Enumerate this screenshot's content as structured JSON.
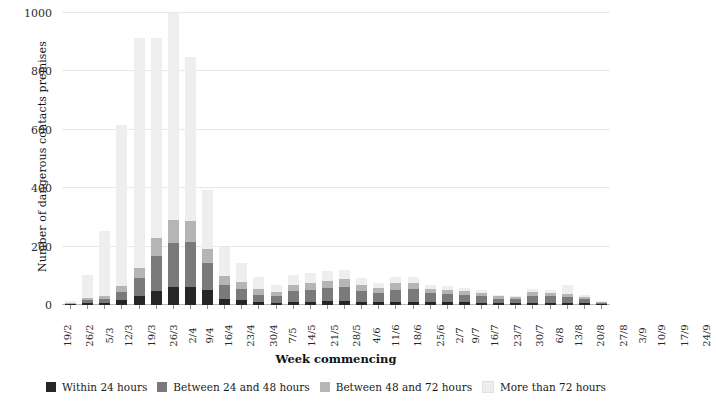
{
  "chart_data": {
    "type": "bar",
    "stacked": true,
    "title": "",
    "xlabel": "Week commencing",
    "ylabel": "Number of dangerous contacts premises",
    "ylim": [
      0,
      1000
    ],
    "yticks": [
      0,
      200,
      400,
      600,
      800,
      1000
    ],
    "ytick_labels": [
      "0",
      "200",
      "400",
      "600",
      "800",
      "1000"
    ],
    "grid": "horizontal",
    "legend_position": "bottom",
    "categories": [
      "19/2",
      "26/2",
      "5/3",
      "12/3",
      "19/3",
      "26/3",
      "2/4",
      "9/4",
      "16/4",
      "23/4",
      "30/4",
      "7/5",
      "14/5",
      "21/5",
      "28/5",
      "4/6",
      "11/6",
      "18/6",
      "25/6",
      "2/7",
      "9/7",
      "16/7",
      "23/7",
      "30/7",
      "6/8",
      "13/8",
      "20/8",
      "27/8",
      "3/9",
      "10/9",
      "17/9",
      "24/9"
    ],
    "series": [
      {
        "name": "Within 24 hours",
        "color": "#262626",
        "values": [
          2,
          6,
          6,
          18,
          30,
          48,
          62,
          62,
          50,
          22,
          16,
          10,
          8,
          12,
          12,
          14,
          14,
          12,
          10,
          12,
          12,
          10,
          10,
          9,
          8,
          6,
          6,
          8,
          8,
          7,
          6,
          3
        ]
      },
      {
        "name": "Between 24 and 48 hours",
        "color": "#7a7a7a",
        "values": [
          3,
          10,
          14,
          26,
          62,
          120,
          150,
          155,
          95,
          48,
          38,
          26,
          22,
          36,
          40,
          44,
          48,
          36,
          30,
          40,
          42,
          30,
          28,
          26,
          22,
          16,
          14,
          24,
          22,
          20,
          14,
          5
        ]
      },
      {
        "name": "Between 48 and 72 hours",
        "color": "#b5b5b5",
        "values": [
          2,
          8,
          12,
          20,
          36,
          62,
          78,
          70,
          48,
          30,
          26,
          18,
          14,
          22,
          24,
          26,
          28,
          22,
          18,
          22,
          22,
          16,
          14,
          13,
          11,
          8,
          7,
          12,
          11,
          10,
          7,
          3
        ]
      },
      {
        "name": "More than 72 hours",
        "color": "#eeeeee",
        "values": [
          6,
          78,
          222,
          551,
          786,
          686,
          710,
          563,
          202,
          100,
          64,
          42,
          26,
          34,
          32,
          32,
          30,
          22,
          18,
          22,
          20,
          14,
          12,
          12,
          9,
          6,
          5,
          10,
          9,
          33,
          8,
          2
        ]
      }
    ]
  },
  "legend": {
    "items": [
      {
        "label": "Within 24 hours",
        "color": "#262626"
      },
      {
        "label": "Between 24 and 48 hours",
        "color": "#7a7a7a"
      },
      {
        "label": "Between 48 and 72 hours",
        "color": "#b5b5b5"
      },
      {
        "label": "More than 72 hours",
        "color": "#eeeeee"
      }
    ]
  }
}
